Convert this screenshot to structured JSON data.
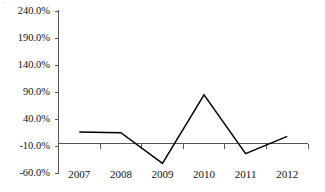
{
  "chart_data": {
    "type": "line",
    "title": "",
    "subtitle": "",
    "xlabel": "",
    "ylabel": "",
    "categories": [
      "2007",
      "2008",
      "2009",
      "2010",
      "2011",
      "2012"
    ],
    "series": [
      {
        "name": "",
        "values": [
          16.0,
          15.0,
          -42.0,
          85.0,
          -24.0,
          8.0
        ],
        "color": "#000000"
      }
    ],
    "ylim": [
      -60.0,
      240.0
    ],
    "ytick_values": [
      240.0,
      190.0,
      140.0,
      90.0,
      40.0,
      -10.0,
      -60.0
    ],
    "ytick_labels": [
      "240.0%",
      "190.0%",
      "140.0%",
      "90.0%",
      "40.0%",
      "-10.0%",
      "-60.0%"
    ],
    "value_suffix": "%",
    "grid": false,
    "legend": "none",
    "zero_axis": 0.0,
    "axis_color": "#555555",
    "line_color": "#000000"
  },
  "artifact": {
    "top_left_remnant": "– –"
  }
}
